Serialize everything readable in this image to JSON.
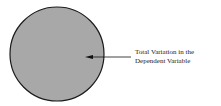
{
  "diagram": {
    "circle": {
      "fill": "#a8a8a8",
      "stroke": "#1a1a1a"
    },
    "label": {
      "line1": "Total Variation in the",
      "line2": "Dependent Variable"
    }
  }
}
